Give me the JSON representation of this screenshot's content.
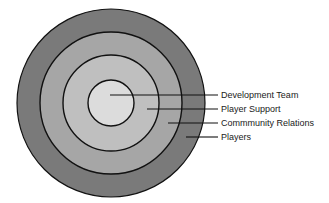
{
  "diagram": {
    "type": "concentric-circles",
    "center": {
      "x": 111,
      "y": 103
    },
    "rings": [
      {
        "name": "Players",
        "radius": 94,
        "fill": "#7a7a7a"
      },
      {
        "name": "Commmunity Relations",
        "radius": 71,
        "fill": "#a6a6a6"
      },
      {
        "name": "Player Support",
        "radius": 48,
        "fill": "#bfbfbf"
      },
      {
        "name": "Development Team",
        "radius": 23,
        "fill": "#dcdcdc"
      }
    ],
    "stroke": "#111111",
    "labels": [
      {
        "text": "Development Team",
        "line_start_x": 110,
        "line_y": 95
      },
      {
        "text": "Player Support",
        "line_start_x": 147,
        "line_y": 109
      },
      {
        "text": "Commmunity Relations",
        "line_start_x": 168,
        "line_y": 123
      },
      {
        "text": "Players",
        "line_start_x": 186,
        "line_y": 137
      }
    ],
    "line_end_x": 218,
    "label_x": 221
  }
}
